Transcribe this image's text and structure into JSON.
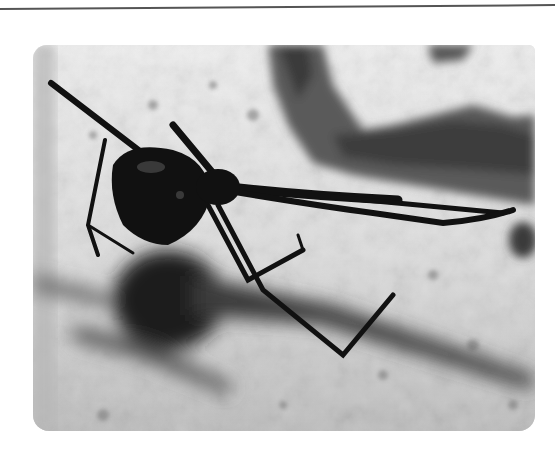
{
  "page": {
    "type": "photograph",
    "colors": {
      "background": "#ffffff",
      "rule": "#555555",
      "wall_light": "#e8e8e8",
      "wall_mid": "#a8a8a8",
      "wall_dark": "#4a4a4a",
      "spider": "#111111",
      "shadow": "#1c1c1c"
    }
  }
}
